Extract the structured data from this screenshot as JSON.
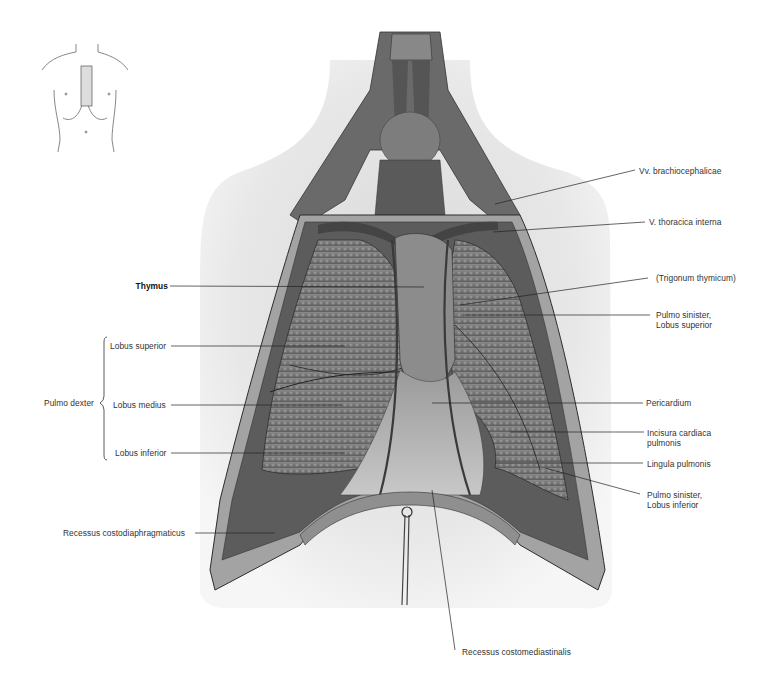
{
  "figure": {
    "orientation_icon": "torso-outline-icon",
    "colors": {
      "background": "#ffffff",
      "silhouette": "#e6e6e6",
      "tissue_dark": "#4a4a4a",
      "tissue_mid": "#7a7a7a",
      "tissue_light": "#bdbdbd",
      "leader": "#222222"
    }
  },
  "labels": {
    "left": {
      "thymus": "Thymus",
      "pulmo_dexter": "Pulmo dexter",
      "lobus_superior": "Lobus superior",
      "lobus_medius": "Lobus medius",
      "lobus_inferior": "Lobus inferior",
      "recessus_costodiaphragmaticus": "Recessus costodiaphragmaticus"
    },
    "right": {
      "vv_brachiocephalicae": "Vv. brachiocephalicae",
      "v_thoracica_interna": "V. thoracica interna",
      "trigonum_thymicum": "(Trigonum thymicum)",
      "pulmo_sinister_sup_1": "Pulmo sinister,",
      "pulmo_sinister_sup_2": "Lobus superior",
      "pericardium": "Pericardium",
      "incisura_1": "Incisura cardiaca",
      "incisura_2": "pulmonis",
      "lingula": "Lingula pulmonis",
      "pulmo_sinister_inf_1": "Pulmo sinister,",
      "pulmo_sinister_inf_2": "Lobus inferior"
    },
    "bottom": {
      "recessus_costomediastinalis": "Recessus costomediastinalis"
    }
  }
}
